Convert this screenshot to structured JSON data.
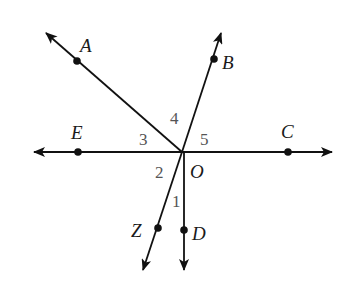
{
  "diagram": {
    "title": "",
    "type": "rays-from-point",
    "colors": {
      "line": "#111111",
      "point_label": "#1a1a1a",
      "angle_label": "#555555",
      "background": "#ffffff"
    },
    "center": {
      "name": "O",
      "label": "O"
    },
    "points": {
      "A": {
        "label": "A"
      },
      "B": {
        "label": "B"
      },
      "C": {
        "label": "C"
      },
      "D": {
        "label": "D"
      },
      "E": {
        "label": "E"
      },
      "Z": {
        "label": "Z"
      }
    },
    "rays": [
      {
        "from": "O",
        "through": "A"
      },
      {
        "from": "O",
        "through": "B"
      },
      {
        "from": "O",
        "through": "C"
      },
      {
        "from": "O",
        "through": "D"
      },
      {
        "from": "O",
        "through": "E"
      },
      {
        "from": "O",
        "through": "Z"
      }
    ],
    "lines": [
      {
        "through": [
          "E",
          "O",
          "C"
        ],
        "description": "line EC through O"
      }
    ],
    "angles": [
      {
        "label": "1",
        "between": [
          "OZ",
          "OD"
        ]
      },
      {
        "label": "2",
        "between": [
          "OE",
          "OZ"
        ]
      },
      {
        "label": "3",
        "between": [
          "OE",
          "OA"
        ]
      },
      {
        "label": "4",
        "between": [
          "OA",
          "OB"
        ]
      },
      {
        "label": "5",
        "between": [
          "OB",
          "OC"
        ]
      }
    ]
  }
}
